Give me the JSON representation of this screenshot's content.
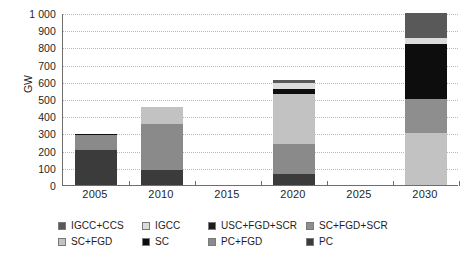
{
  "chart_data": {
    "type": "bar",
    "subtype": "stacked-bar",
    "title": "",
    "xlabel": "",
    "ylabel": "GW",
    "categories": [
      "2005",
      "2010",
      "2015",
      "2020",
      "2025",
      "2030"
    ],
    "tick_labels_x": [
      "2005",
      "2010",
      "2015",
      "2020",
      "2025",
      "2030"
    ],
    "tick_labels_y": [
      "0",
      "100",
      "200",
      "300",
      "400",
      "500",
      "600",
      "700",
      "800",
      "900",
      "1 000"
    ],
    "ylim": [
      0,
      1000
    ],
    "ytick_step": 100,
    "grid": true,
    "grid_axis": "y",
    "legend_position": "bottom",
    "series": [
      {
        "name": "IGCC+CCS",
        "color": "#595959",
        "values": [
          0,
          0,
          0,
          18,
          0,
          145
        ]
      },
      {
        "name": "IGCC",
        "color": "#dcdcdc",
        "values": [
          0,
          0,
          0,
          35,
          0,
          33
        ]
      },
      {
        "name": "USC+FGD+SCR",
        "color": "#1c1c1c",
        "values": [
          0,
          0,
          0,
          0,
          0,
          0
        ]
      },
      {
        "name": "SC+FGD+SCR",
        "color": "#8e8e8e",
        "values": [
          0,
          0,
          0,
          0,
          0,
          200
        ]
      },
      {
        "name": "SC+FGD",
        "color": "#c2c2c2",
        "values": [
          0,
          100,
          0,
          290,
          0,
          300
        ]
      },
      {
        "name": "SC",
        "color": "#0d0d0d",
        "values": [
          6,
          0,
          0,
          27,
          0,
          322
        ]
      },
      {
        "name": "PC+FGD",
        "color": "#8a8a8a",
        "values": [
          90,
          265,
          0,
          175,
          0,
          0
        ]
      },
      {
        "name": "PC",
        "color": "#3b3b3b",
        "values": [
          202,
          90,
          0,
          65,
          0,
          0
        ]
      }
    ],
    "stack_order_bottom_to_top": [
      "PC",
      "PC+FGD",
      "SC+FGD",
      "SC+FGD+SCR",
      "SC",
      "USC+FGD+SCR",
      "IGCC",
      "IGCC+CCS"
    ],
    "bars": [
      {
        "category": "2005",
        "total": 298,
        "segments": [
          {
            "name": "PC",
            "from": 0,
            "to": 202,
            "value": 202,
            "color": "#3b3b3b"
          },
          {
            "name": "PC+FGD",
            "from": 202,
            "to": 292,
            "value": 90,
            "color": "#8a8a8a"
          },
          {
            "name": "SC",
            "from": 292,
            "to": 298,
            "value": 6,
            "color": "#0d0d0d"
          }
        ]
      },
      {
        "category": "2010",
        "total": 455,
        "segments": [
          {
            "name": "PC",
            "from": 0,
            "to": 90,
            "value": 90,
            "color": "#3b3b3b"
          },
          {
            "name": "PC+FGD",
            "from": 90,
            "to": 355,
            "value": 265,
            "color": "#8a8a8a"
          },
          {
            "name": "SC+FGD",
            "from": 355,
            "to": 455,
            "value": 100,
            "color": "#c2c2c2"
          }
        ]
      },
      {
        "category": "2015",
        "total": 0,
        "segments": []
      },
      {
        "category": "2020",
        "total": 610,
        "segments": [
          {
            "name": "PC",
            "from": 0,
            "to": 65,
            "value": 65,
            "color": "#3b3b3b"
          },
          {
            "name": "PC+FGD",
            "from": 65,
            "to": 240,
            "value": 175,
            "color": "#8a8a8a"
          },
          {
            "name": "SC+FGD",
            "from": 240,
            "to": 530,
            "value": 290,
            "color": "#c2c2c2"
          },
          {
            "name": "SC",
            "from": 530,
            "to": 557,
            "value": 27,
            "color": "#0d0d0d"
          },
          {
            "name": "IGCC",
            "from": 557,
            "to": 592,
            "value": 35,
            "color": "#dcdcdc"
          },
          {
            "name": "IGCC+CCS",
            "from": 592,
            "to": 610,
            "value": 18,
            "color": "#595959"
          }
        ]
      },
      {
        "category": "2025",
        "total": 0,
        "segments": []
      },
      {
        "category": "2030",
        "total": 1000,
        "segments": [
          {
            "name": "SC+FGD",
            "from": 0,
            "to": 300,
            "value": 300,
            "color": "#c2c2c2"
          },
          {
            "name": "SC+FGD+SCR",
            "from": 300,
            "to": 500,
            "value": 200,
            "color": "#8e8e8e"
          },
          {
            "name": "SC",
            "from": 500,
            "to": 822,
            "value": 322,
            "color": "#0d0d0d"
          },
          {
            "name": "IGCC",
            "from": 822,
            "to": 855,
            "value": 33,
            "color": "#dcdcdc"
          },
          {
            "name": "IGCC+CCS",
            "from": 855,
            "to": 1000,
            "value": 145,
            "color": "#595959"
          }
        ]
      }
    ],
    "legend": [
      {
        "label": "IGCC+CCS",
        "color": "#595959"
      },
      {
        "label": "IGCC",
        "color": "#dcdcdc"
      },
      {
        "label": "USC+FGD+SCR",
        "color": "#1c1c1c"
      },
      {
        "label": "SC+FGD+SCR",
        "color": "#8e8e8e"
      },
      {
        "label": "SC+FGD",
        "color": "#c2c2c2"
      },
      {
        "label": "SC",
        "color": "#0d0d0d"
      },
      {
        "label": "PC+FGD",
        "color": "#8a8a8a"
      },
      {
        "label": "PC",
        "color": "#3b3b3b"
      }
    ],
    "legend_rows": [
      [
        0,
        1,
        2,
        3
      ],
      [
        4,
        5,
        6,
        7
      ]
    ],
    "colors": {
      "axis": "#6d6d6d",
      "grid": "#b9b9b9",
      "text": "#262626",
      "background": "#ffffff"
    }
  }
}
